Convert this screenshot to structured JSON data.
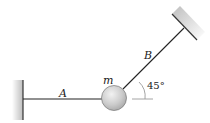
{
  "diagram": {
    "labels": {
      "rope_a": "A",
      "rope_b": "B",
      "mass": "m",
      "angle": "45°"
    },
    "colors": {
      "line": "#222222",
      "wall_shade": "#cfcfcf",
      "ball_fill": "#c8c8c8",
      "ball_highlight": "#eeeeee",
      "reference_line": "#9a9a9a"
    }
  }
}
